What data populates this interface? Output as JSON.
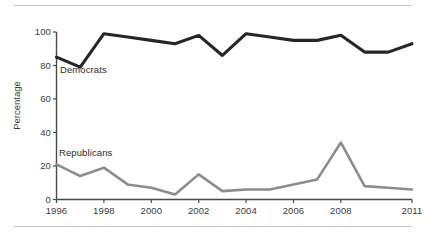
{
  "chart_data": {
    "type": "line",
    "title": "",
    "subtitle": "",
    "xlabel": "",
    "ylabel": "Percentage",
    "xlim": [
      1996,
      2011
    ],
    "ylim": [
      0,
      100
    ],
    "grid": false,
    "legend_position": "inline-annotations",
    "x": [
      1996,
      1997,
      1998,
      1999,
      2000,
      2001,
      2002,
      2003,
      2004,
      2005,
      2006,
      2007,
      2008,
      2009,
      2010,
      2011
    ],
    "xtick_labels": [
      "1996",
      "1998",
      "2000",
      "2002",
      "2004",
      "2006",
      "2008",
      "2011"
    ],
    "xtick_values": [
      1996,
      1998,
      2000,
      2002,
      2004,
      2006,
      2008,
      2011
    ],
    "ytick_labels": [
      "0",
      "20",
      "40",
      "60",
      "80",
      "100"
    ],
    "ytick_values": [
      0,
      20,
      40,
      60,
      80,
      100
    ],
    "series": [
      {
        "name": "Democrats",
        "color": "#262626",
        "values": [
          85,
          79,
          99,
          97,
          95,
          93,
          98,
          86,
          99,
          97,
          95,
          95,
          98,
          88,
          88,
          93
        ]
      },
      {
        "name": "Republicans",
        "color": "#8c8c8c",
        "values": [
          21,
          14,
          19,
          9,
          7,
          3,
          15,
          5,
          6,
          6,
          9,
          12,
          34,
          8,
          7,
          6
        ]
      }
    ],
    "annotations": [
      {
        "text": "Democrats",
        "series": "Democrats"
      },
      {
        "text": "Republicans",
        "series": "Republicans"
      }
    ]
  },
  "axes": {
    "y_title": "Percentage",
    "y_ticks": [
      "100",
      "80",
      "60",
      "40",
      "20",
      "0"
    ],
    "x_ticks": [
      "1996",
      "1998",
      "2000",
      "2002",
      "2004",
      "2006",
      "2008",
      "2011"
    ]
  },
  "labels": {
    "democrats": "Democrats",
    "republicans": "Republicans"
  },
  "colors": {
    "democrats_line": "#262626",
    "republicans_line": "#8c8c8c",
    "axis": "#4a4a4a",
    "rule": "#c8c8c8",
    "text": "#3a3a3a",
    "background": "#ffffff"
  }
}
